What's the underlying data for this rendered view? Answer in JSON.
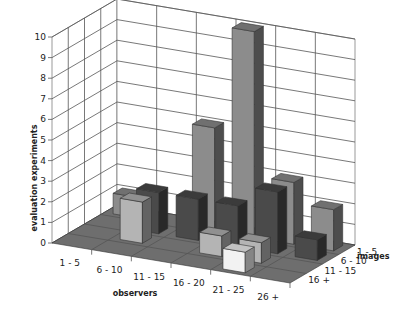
{
  "chart_data": {
    "type": "bar3d",
    "title": "",
    "xlabel": "observers",
    "ylabel": "images",
    "zlabel": "evaluation experiments",
    "x_categories": [
      "1 - 5",
      "6 - 10",
      "11 - 15",
      "16 - 20",
      "21 - 25",
      "26 +"
    ],
    "y_categories": [
      "1 - 5",
      "6 - 10",
      "11 - 15",
      "16 +"
    ],
    "z_ticks": [
      "0",
      "1",
      "2",
      "3",
      "4",
      "5",
      "6",
      "7",
      "8",
      "9",
      "10"
    ],
    "zlim": [
      0,
      10
    ],
    "series": [
      {
        "name": "1 - 5",
        "color": "#8c8c8c",
        "values": [
          1,
          0,
          5,
          10,
          3,
          2
        ]
      },
      {
        "name": "6 - 10",
        "color": "#4a4a4a",
        "values": [
          0,
          2,
          2,
          2,
          3,
          1
        ]
      },
      {
        "name": "11 - 15",
        "color": "#b4b4b4",
        "values": [
          0,
          2,
          0,
          1,
          1,
          0
        ]
      },
      {
        "name": "16 +",
        "color": "#f2f2f2",
        "values": [
          0,
          0,
          0,
          0,
          1,
          0
        ]
      }
    ],
    "grid": true,
    "floor_color": "#6e6e6e"
  }
}
